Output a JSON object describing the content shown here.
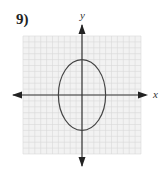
{
  "problem": {
    "number": "9)"
  },
  "chart_data": {
    "type": "line",
    "title": "",
    "xlabel": "x",
    "ylabel": "y",
    "xlim": [
      -10,
      10
    ],
    "ylim": [
      -10,
      10
    ],
    "grid": true,
    "grid_step": 1,
    "series": [
      {
        "name": "ellipse",
        "shape": "ellipse",
        "center": [
          0,
          0
        ],
        "semi_axis_x": 4,
        "semi_axis_y": 6,
        "equation": "x^2/16 + y^2/36 = 1",
        "points": [
          [
            4,
            0
          ],
          [
            0,
            6
          ],
          [
            -4,
            0
          ],
          [
            0,
            -6
          ]
        ]
      }
    ]
  },
  "axes": {
    "x_label": "x",
    "y_label": "y"
  },
  "colors": {
    "grid": "#d8d8d8",
    "axis": "#333333",
    "curve": "#444444"
  }
}
